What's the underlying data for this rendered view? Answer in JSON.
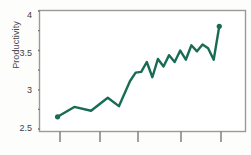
{
  "axes": {
    "ylabel": "Productivity",
    "yticks": [
      {
        "value": 4,
        "label": "4"
      },
      {
        "value": 3.5,
        "label": "3.5"
      },
      {
        "value": 3,
        "label": "3"
      },
      {
        "value": 2.5,
        "label": "2.5"
      }
    ],
    "xticks_labels": [
      "",
      "",
      "",
      "",
      ""
    ]
  },
  "style": {
    "line_color": "#1a6b54",
    "frame_color": "#9a9a98",
    "tick_color": "#6f6f6d",
    "text_color": "#3f3f3f"
  },
  "chart_data": {
    "type": "line",
    "title": "",
    "xlabel": "",
    "ylabel": "Productivity",
    "ylim": [
      2.45,
      4.0
    ],
    "xlim": [
      0,
      33
    ],
    "grid": false,
    "legend": null,
    "ytick_values": [
      2.5,
      3.0,
      3.5,
      4.0
    ],
    "ytick_labels": [
      "2.5",
      "3",
      "3.5",
      "4"
    ],
    "xtick_values": [
      3,
      9,
      15,
      22,
      28
    ],
    "xtick_labels": [
      "",
      "",
      "",
      "",
      ""
    ],
    "minor_yticks": [
      2.75,
      3.25,
      3.75
    ],
    "markers": "endpoints-only",
    "series": [
      {
        "name": "Productivity",
        "color": "#1a6b54",
        "x": [
          1,
          4,
          7,
          10,
          12,
          14,
          15,
          16,
          17,
          18,
          19,
          20,
          21,
          22,
          23,
          24,
          25,
          26,
          27,
          28,
          29,
          30
        ],
        "values": [
          2.61,
          2.74,
          2.69,
          2.86,
          2.75,
          3.08,
          3.19,
          3.2,
          3.33,
          3.13,
          3.37,
          3.27,
          3.42,
          3.33,
          3.48,
          3.36,
          3.55,
          3.47,
          3.56,
          3.51,
          3.36,
          3.8
        ]
      }
    ]
  }
}
